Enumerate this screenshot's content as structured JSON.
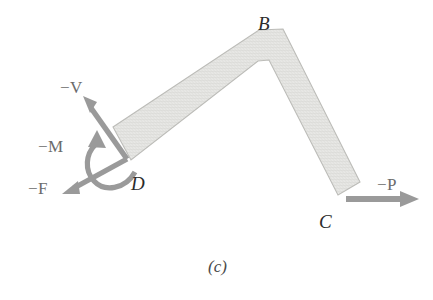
{
  "figure": {
    "caption": "(c)",
    "background_color": "#ffffff",
    "body_fill_color": "#e4e4e1",
    "body_stroke_color": "#b8b8b4",
    "arrow_color": "#9a9a9a",
    "label_color": "#6b6b6b",
    "point_label_color": "#2b2b2b"
  },
  "point_labels": [
    {
      "name": "point-b",
      "text": "B",
      "x": 258,
      "y": 14
    },
    {
      "name": "point-c",
      "text": "C",
      "x": 319,
      "y": 212
    },
    {
      "name": "point-d",
      "text": "D",
      "x": 131,
      "y": 174
    }
  ],
  "force_labels": [
    {
      "name": "force-minus-v",
      "text": "−V",
      "x": 60,
      "y": 79
    },
    {
      "name": "force-minus-m",
      "text": "−M",
      "x": 38,
      "y": 138
    },
    {
      "name": "force-minus-f",
      "text": "−F",
      "x": 28,
      "y": 180
    },
    {
      "name": "force-minus-p",
      "text": "−P",
      "x": 377,
      "y": 176
    }
  ],
  "geometry": {
    "bar_outline_points": "113,127 259,30 283,29 360,182 338,195 269,60 258,61 131,160",
    "vertex_b_outer": {
      "x": 264,
      "y": 26
    },
    "vertex_b_inner": {
      "x": 262,
      "y": 61
    },
    "end_d": {
      "x": 122,
      "y": 143
    },
    "end_c": {
      "x": 349,
      "y": 189
    }
  },
  "arrows": {
    "minus_v": {
      "from_x": 126,
      "from_y": 158,
      "to_x": 85,
      "to_y": 100,
      "type": "straight"
    },
    "minus_m": {
      "type": "curved-moment",
      "arrowhead_dir": "up"
    },
    "minus_f": {
      "from_x": 126,
      "from_y": 158,
      "to_x": 64,
      "to_y": 192,
      "type": "straight"
    },
    "minus_p": {
      "from_x": 346,
      "from_y": 198,
      "to_x": 417,
      "to_y": 198,
      "type": "straight"
    }
  }
}
